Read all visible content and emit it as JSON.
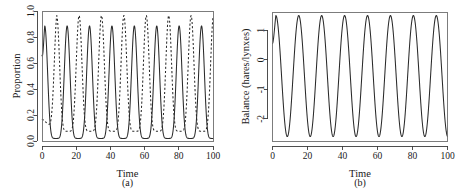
{
  "figure": {
    "panels": [
      {
        "caption": "(a)",
        "xlabel": "Time",
        "ylabel": "Proportion",
        "xticks": [
          0,
          20,
          40,
          60,
          80,
          100
        ],
        "yticks": [
          "0.0",
          "0.2",
          "0.4",
          "0.6",
          "0.8",
          "1.0"
        ],
        "ytick_values": [
          0.0,
          0.2,
          0.4,
          0.6,
          0.8,
          1.0
        ]
      },
      {
        "caption": "(b)",
        "xlabel": "Time",
        "ylabel": "Balance (hares/lynxes)",
        "xticks": [
          0,
          20,
          40,
          60,
          80,
          100
        ],
        "yticks": [
          "-2",
          "-1",
          "0",
          "1"
        ],
        "ytick_values": [
          -2,
          -1,
          0,
          1
        ]
      }
    ]
  },
  "chart_data": [
    {
      "type": "line",
      "title": "",
      "panel": "(a)",
      "xlabel": "Time",
      "ylabel": "Proportion",
      "xlim": [
        0,
        100
      ],
      "ylim": [
        0.0,
        1.0
      ],
      "grid": false,
      "legend": "none",
      "series": [
        {
          "name": "hares-proportion",
          "style": "solid",
          "color": "#2a2a2a",
          "period": 13.1,
          "peak": 0.885,
          "trough": 0.02,
          "first_peak_x": 1.6,
          "sharpness": 3.2,
          "initial_value": 0.66,
          "peaks_x": [
            1.6,
            14.7,
            27.8,
            40.9,
            54.0,
            67.1,
            80.2,
            93.3
          ],
          "troughs_x": [
            8.1,
            21.2,
            34.3,
            47.4,
            60.5,
            73.6,
            86.7,
            99.8
          ]
        },
        {
          "name": "lynxes-proportion",
          "style": "dashed",
          "color": "#2a2a2a",
          "period": 13.1,
          "peak": 0.965,
          "trough": 0.075,
          "first_peak_x": 8.6,
          "sharpness": 3.2,
          "initial_value": 0.17,
          "peaks_x": [
            8.6,
            21.7,
            34.8,
            47.9,
            61.0,
            74.1,
            87.2,
            100.0
          ],
          "troughs_x": [
            2.1,
            15.2,
            28.3,
            41.4,
            54.5,
            67.6,
            80.7,
            93.8
          ]
        }
      ]
    },
    {
      "type": "line",
      "title": "",
      "panel": "(b)",
      "xlabel": "Time",
      "ylabel": "Balance (hares/lynxes)",
      "xlim": [
        0,
        100
      ],
      "ylim": [
        -2.75,
        1.62
      ],
      "grid": false,
      "legend": "none",
      "series": [
        {
          "name": "log-balance",
          "style": "solid",
          "color": "#2a2a2a",
          "period": 13.1,
          "peak": 1.5,
          "trough": -2.6,
          "first_peak_x": 1.9,
          "sharpness": 1.0,
          "initial_value": 0.55,
          "peaks_x": [
            1.9,
            15.0,
            28.1,
            41.2,
            54.3,
            67.4,
            80.5,
            93.6
          ],
          "troughs_x": [
            8.4,
            21.5,
            34.6,
            47.7,
            60.8,
            73.9,
            87.0,
            100.0
          ]
        }
      ]
    }
  ]
}
